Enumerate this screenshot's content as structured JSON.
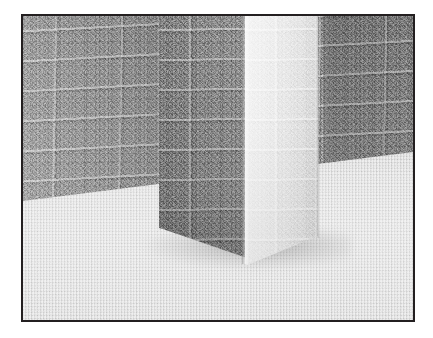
{
  "scene": {
    "title": "Stone pillar and masonry wall render",
    "render_type": "3d-rendered-grayscale-scene",
    "description": "A square stone pillar stands on a speckled gravel ground plane in front of a large masonry block wall. Light comes from the right, brightly illuminating the pillar's right-hand face while its left face and the wall behind remain in shadow.",
    "palette": {
      "frame_border": "#231f20",
      "page_background": "#ffffff",
      "wall_base": "#989898",
      "wall_shadow": "#7d7d7d",
      "wall_highlight": "#b4b4b4",
      "ground_base": "#d2d2d2",
      "ground_shadow": "#c0c0c0",
      "pillar_lit_face": "#ececec",
      "pillar_shaded_face": "#878787",
      "pillar_corner_highlight": "#ffffff"
    },
    "lighting": {
      "key_light_direction": "right",
      "description": "directional key light from the upper right"
    },
    "materials": [
      {
        "name": "masonry-block-wall",
        "finish": "rough bump-mapped stone blocks with mortar joints"
      },
      {
        "name": "pillar-stone",
        "finish": "same block masonry, coarse chiselled surface"
      },
      {
        "name": "ground-gravel",
        "finish": "fine speckled noise, matte"
      }
    ],
    "objects": [
      {
        "name": "back-wall",
        "label": "Masonry block wall",
        "tone": "mid gray, shaded toward the right"
      },
      {
        "name": "pillar",
        "label": "Square stone pillar",
        "tone": "left face shaded, right face brightly lit"
      },
      {
        "name": "ground-plane",
        "label": "Speckled ground plane",
        "tone": "light gray"
      },
      {
        "name": "contact-shadow",
        "label": "Contact shadow at pillar base",
        "tone": "soft dark gray"
      }
    ],
    "frame": {
      "style": "thin dark rectangular border",
      "border_color": "#231f20",
      "border_width_px": 2
    }
  }
}
